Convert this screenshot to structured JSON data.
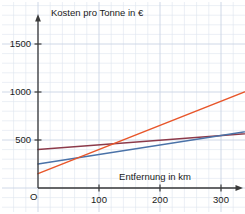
{
  "chart_data": {
    "type": "line",
    "title": "",
    "xlabel": "Entfernung in km",
    "ylabel": "Kosten pro Tonne in €",
    "origin_label": "O",
    "xlim": [
      0,
      460
    ],
    "ylim": [
      0,
      1600
    ],
    "xticks": [
      100,
      200,
      300,
      400
    ],
    "xtick_labels": [
      "100",
      "200",
      "300",
      "400"
    ],
    "yticks": [
      500,
      1000,
      1500
    ],
    "ytick_labels": [
      "500",
      "1000",
      "1500"
    ],
    "grid": true,
    "grid_minor_step_x": 20,
    "grid_major_step_x": 100,
    "grid_minor_step_y": 100,
    "grid_major_step_y": 500,
    "legend_position": "inline-right",
    "series": [
      {
        "name": "Schiff",
        "label": "Schiff",
        "color": "#8c3a4a",
        "x": [
          0,
          460
        ],
        "values": [
          400,
          625
        ]
      },
      {
        "name": "Bahn",
        "label": "",
        "color": "#4a72a8",
        "x": [
          0,
          460
        ],
        "values": [
          250,
          705
        ]
      },
      {
        "name": "LKW",
        "label": "",
        "color": "#e8562a",
        "x": [
          0,
          460
        ],
        "values": [
          150,
          1305
        ]
      }
    ],
    "annotations": [
      {
        "text": "Schiff",
        "x": 370,
        "y": 455,
        "color": "#8c3a4a"
      }
    ],
    "colors": {
      "grid_minor": "#dde4ee",
      "grid_major": "#c9d4e4",
      "axis": "#3a3a3a",
      "text": "#1a1a1a",
      "background": "#ffffff"
    }
  }
}
